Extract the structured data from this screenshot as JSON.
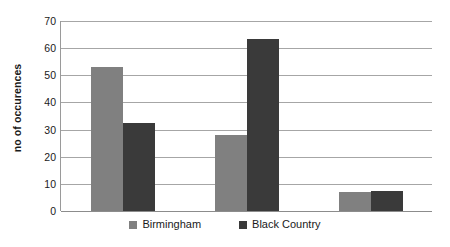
{
  "chart_data": {
    "type": "bar",
    "title": "",
    "xlabel": "",
    "ylabel": "no of occurences",
    "ylim": [
      0,
      70
    ],
    "ytick_step": 10,
    "yticks": [
      70,
      60,
      50,
      40,
      30,
      20,
      10,
      0
    ],
    "ytick_labels": [
      "70",
      "60",
      "50",
      "40",
      "30",
      "20",
      "10",
      "0"
    ],
    "grid": true,
    "xtick_labels": [
      "",
      "",
      ""
    ],
    "categories": [
      "Group 1",
      "Group 2",
      "Group 3"
    ],
    "legend_position": "bottom-center",
    "series": [
      {
        "name": "Birmingham",
        "color": "#808080",
        "values": [
          53,
          28,
          7
        ]
      },
      {
        "name": "Black Country",
        "color": "#3a3a3a",
        "values": [
          32.5,
          63.5,
          7.5
        ]
      }
    ]
  },
  "legend": {
    "entries": [
      {
        "label": "Birmingham",
        "color": "#808080"
      },
      {
        "label": "Black Country",
        "color": "#3a3a3a"
      }
    ]
  },
  "style": {
    "gridline_color": "#a6a6a6",
    "axis_color": "#9a9a9a",
    "background": "#ffffff",
    "text_color": "#1a1a1a"
  }
}
